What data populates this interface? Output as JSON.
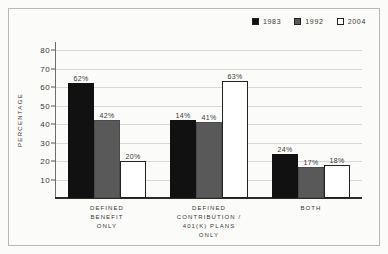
{
  "chart_data": {
    "type": "bar",
    "title": "",
    "xlabel": "",
    "ylabel": "PERCENTAGE",
    "ylim": [
      0,
      80
    ],
    "yticks": [
      10,
      20,
      30,
      40,
      50,
      60,
      70,
      80
    ],
    "grid": true,
    "legend_position": "top-right",
    "categories": [
      "DEFINED\nBENEFIT\nONLY",
      "DEFINED\nCONTRIBUTION /\n401(K) PLANS\nONLY",
      "BOTH"
    ],
    "series": [
      {
        "name": "1983",
        "color": "#111111",
        "values": [
          62,
          42,
          24
        ]
      },
      {
        "name": "1992",
        "color": "#595959",
        "values": [
          42,
          41,
          17
        ]
      },
      {
        "name": "2004",
        "color": "#ffffff",
        "values": [
          20,
          63,
          18
        ]
      }
    ],
    "data_labels": [
      [
        "62%",
        "42%",
        "20%"
      ],
      [
        "14%",
        "41%",
        "63%"
      ],
      [
        "24%",
        "17%",
        "18%"
      ]
    ],
    "values_by_category": [
      {
        "category": "DEFINED BENEFIT ONLY",
        "1983": 62,
        "1992": 42,
        "2004": 20
      },
      {
        "category": "DEFINED CONTRIBUTION / 401(K) PLANS ONLY",
        "1983": 14,
        "1992": 41,
        "2004": 63
      },
      {
        "category": "BOTH",
        "1983": 24,
        "1992": 17,
        "2004": 18
      }
    ]
  },
  "legend": {
    "items": [
      {
        "label": "1983",
        "swatch": "#111111"
      },
      {
        "label": "1992",
        "swatch": "#595959"
      },
      {
        "label": "2004",
        "swatch": "#ffffff"
      }
    ]
  },
  "axis": {
    "y_title": "PERCENTAGE",
    "y_tick_labels": [
      "80",
      "70",
      "60",
      "50",
      "40",
      "30",
      "20",
      "10"
    ]
  },
  "categories": [
    {
      "lines": [
        "DEFINED",
        "BENEFIT",
        "ONLY"
      ]
    },
    {
      "lines": [
        "DEFINED",
        "CONTRIBUTION /",
        "401(K) PLANS",
        "ONLY"
      ]
    },
    {
      "lines": [
        "BOTH"
      ]
    }
  ]
}
